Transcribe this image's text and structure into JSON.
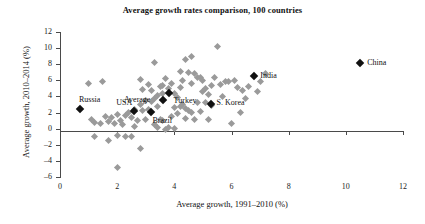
{
  "chart_data": {
    "type": "scatter",
    "title": "Average growth rates comparison, 100 countries",
    "xlabel": "Average growth, 1991–2010 (%)",
    "ylabel": "Average growth, 2010–2014 (%)",
    "xlim": [
      0,
      12
    ],
    "ylim": [
      -6,
      12
    ],
    "xticks": [
      0,
      2,
      4,
      6,
      8,
      10,
      12
    ],
    "yticks": [
      12,
      10,
      8,
      6,
      4,
      2,
      0,
      -2,
      -4,
      -6
    ],
    "grid": false,
    "legend": null,
    "series": [
      {
        "name": "countries",
        "color": "#9a9a9a",
        "points": [
          [
            1.0,
            5.6
          ],
          [
            1.5,
            5.9
          ],
          [
            2.8,
            6.1
          ],
          [
            3.3,
            8.2
          ],
          [
            3.6,
            5.4
          ],
          [
            3.0,
            3.5
          ],
          [
            3.2,
            3.4
          ],
          [
            3.4,
            4.1
          ],
          [
            3.5,
            5.2
          ],
          [
            3.6,
            4.4
          ],
          [
            3.8,
            5.0
          ],
          [
            3.9,
            5.6
          ],
          [
            4.0,
            4.4
          ],
          [
            4.1,
            3.9
          ],
          [
            4.2,
            5.1
          ],
          [
            4.3,
            6.0
          ],
          [
            4.4,
            8.6
          ],
          [
            4.6,
            9.0
          ],
          [
            4.5,
            7.0
          ],
          [
            4.6,
            5.6
          ],
          [
            4.7,
            6.9
          ],
          [
            4.8,
            6.4
          ],
          [
            4.9,
            6.3
          ],
          [
            5.0,
            4.6
          ],
          [
            5.1,
            5.0
          ],
          [
            5.2,
            4.2
          ],
          [
            5.3,
            5.3
          ],
          [
            5.4,
            6.3
          ],
          [
            5.5,
            10.2
          ],
          [
            5.6,
            5.5
          ],
          [
            5.8,
            5.9
          ],
          [
            5.9,
            5.8
          ],
          [
            6.1,
            6.0
          ],
          [
            6.2,
            5.1
          ],
          [
            6.4,
            4.8
          ],
          [
            7.2,
            6.8
          ],
          [
            7.0,
            5.9
          ],
          [
            6.9,
            4.6
          ],
          [
            6.5,
            3.7
          ],
          [
            6.0,
            0.6
          ],
          [
            5.2,
            1.1
          ],
          [
            4.6,
            2.0
          ],
          [
            4.5,
            2.2
          ],
          [
            4.4,
            2.5
          ],
          [
            4.3,
            3.0
          ],
          [
            4.2,
            2.7
          ],
          [
            4.1,
            1.9
          ],
          [
            4.0,
            2.6
          ],
          [
            3.9,
            1.5
          ],
          [
            3.8,
            0.2
          ],
          [
            3.7,
            -0.1
          ],
          [
            3.6,
            1.0
          ],
          [
            3.5,
            1.2
          ],
          [
            3.4,
            2.8
          ],
          [
            3.3,
            3.8
          ],
          [
            3.2,
            4.8
          ],
          [
            3.1,
            2.4
          ],
          [
            3.0,
            1.1
          ],
          [
            2.9,
            2.2
          ],
          [
            2.8,
            3.0
          ],
          [
            2.7,
            1.0
          ],
          [
            2.6,
            0.3
          ],
          [
            2.5,
            1.4
          ],
          [
            2.4,
            2.0
          ],
          [
            2.3,
            1.6
          ],
          [
            2.2,
            0.5
          ],
          [
            2.1,
            1.0
          ],
          [
            2.0,
            1.8
          ],
          [
            1.9,
            0.6
          ],
          [
            1.8,
            1.4
          ],
          [
            1.7,
            0.9
          ],
          [
            1.6,
            1.5
          ],
          [
            1.4,
            0.7
          ],
          [
            1.2,
            0.8
          ],
          [
            1.1,
            1.2
          ],
          [
            2.0,
            -0.9
          ],
          [
            2.3,
            -1.0
          ],
          [
            1.2,
            -1.0
          ],
          [
            1.7,
            -1.5
          ],
          [
            2.5,
            -1.0
          ],
          [
            2.8,
            -2.4
          ],
          [
            2.0,
            -4.8
          ],
          [
            3.4,
            0.1
          ],
          [
            4.8,
            3.3
          ],
          [
            5.0,
            6.0
          ],
          [
            5.1,
            3.2
          ],
          [
            4.9,
            2.1
          ],
          [
            4.4,
            1.3
          ],
          [
            4.7,
            1.1
          ],
          [
            5.3,
            2.9
          ],
          [
            3.7,
            6.2
          ],
          [
            3.1,
            5.5
          ],
          [
            2.9,
            4.9
          ],
          [
            4.2,
            7.1
          ],
          [
            5.7,
            4.0
          ],
          [
            6.6,
            5.2
          ],
          [
            6.3,
            2.0
          ],
          [
            3.3,
            0.5
          ],
          [
            4.0,
            0.0
          ],
          [
            2.6,
            2.4
          ]
        ]
      },
      {
        "name": "highlighted",
        "color": "#111111",
        "points": [
          {
            "label": "Russia",
            "x": 0.7,
            "y": 2.4,
            "label_dx": -1,
            "label_dy": -13
          },
          {
            "label": "USA",
            "x": 2.6,
            "y": 2.2,
            "label_dx": -18,
            "label_dy": -12
          },
          {
            "label": "Average",
            "x": 3.6,
            "y": 3.5,
            "label_dx": -39,
            "label_dy": -4
          },
          {
            "label": "Brazil",
            "x": 3.2,
            "y": 2.1,
            "label_dx": 1,
            "label_dy": 5
          },
          {
            "label": "Turkey",
            "x": 3.8,
            "y": 4.4,
            "label_dx": 5,
            "label_dy": 4
          },
          {
            "label": "S. Korea",
            "x": 5.3,
            "y": 3.1,
            "label_dx": 5,
            "label_dy": -5
          },
          {
            "label": "India",
            "x": 6.8,
            "y": 6.5,
            "label_dx": 6,
            "label_dy": -4
          },
          {
            "label": "China",
            "x": 10.5,
            "y": 8.1,
            "label_dx": 7,
            "label_dy": -4
          }
        ]
      }
    ]
  }
}
